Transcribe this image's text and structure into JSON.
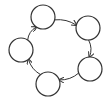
{
  "diagram": {
    "type": "cycle",
    "stroke_color": "#333333",
    "background": "#ffffff",
    "nodes": [
      {
        "id": "n1",
        "label": "",
        "cx": 43,
        "cy": 17,
        "r": 12
      },
      {
        "id": "n2",
        "label": "",
        "cx": 88,
        "cy": 28,
        "r": 12
      },
      {
        "id": "n3",
        "label": "",
        "cx": 90,
        "cy": 69,
        "r": 12
      },
      {
        "id": "n4",
        "label": "",
        "cx": 48,
        "cy": 84,
        "r": 12
      },
      {
        "id": "n5",
        "label": "",
        "cx": 21,
        "cy": 50,
        "r": 12
      }
    ],
    "edges": [
      {
        "from": "n1",
        "to": "n2"
      },
      {
        "from": "n2",
        "to": "n3"
      },
      {
        "from": "n3",
        "to": "n4"
      },
      {
        "from": "n4",
        "to": "n5"
      },
      {
        "from": "n5",
        "to": "n1"
      }
    ]
  }
}
